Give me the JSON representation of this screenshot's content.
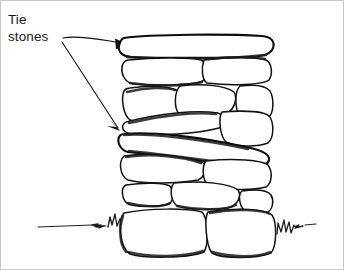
{
  "figure": {
    "kind": "line-drawing",
    "background_color": "#ffffff",
    "ink_color": "#111111",
    "border_color": "#c8c8c8"
  },
  "annotations": {
    "tie_stones_label": {
      "line1": "Tie",
      "line2": "stones",
      "text": "Tie stones",
      "color": "#1a1a1a"
    },
    "leaders": [
      {
        "name": "leader-to-top-tie-stone",
        "from": [
          64,
          37
        ],
        "to": [
          124,
          44
        ],
        "arrow": "right"
      },
      {
        "name": "leader-to-middle-tie-stone",
        "from": [
          64,
          40
        ],
        "to": [
          121,
          131
        ],
        "arrow": "down-right"
      }
    ]
  },
  "wall": {
    "left_edge": 115,
    "right_edge": 274,
    "top_edge": 36,
    "bottom_edge": 258,
    "courses": [
      {
        "name": "course-1-tie-stone",
        "stone_count": 1,
        "tie_stone": true
      },
      {
        "name": "course-2",
        "stone_count": 2,
        "tie_stone": false
      },
      {
        "name": "course-3",
        "stone_count": 3,
        "tie_stone": false
      },
      {
        "name": "course-4",
        "stone_count": 2,
        "tie_stone": false
      },
      {
        "name": "course-5-tie-stone",
        "stone_count": 1,
        "tie_stone": true
      },
      {
        "name": "course-6",
        "stone_count": 2,
        "tie_stone": false
      },
      {
        "name": "course-7",
        "stone_count": 3,
        "tie_stone": false
      },
      {
        "name": "course-8-base",
        "stone_count": 2,
        "tie_stone": false
      }
    ]
  },
  "ground": {
    "name": "ground-line",
    "left_segment": [
      40,
      228,
      115,
      222
    ],
    "right_segment": [
      274,
      222,
      312,
      226
    ],
    "grass_tufts": 2
  }
}
